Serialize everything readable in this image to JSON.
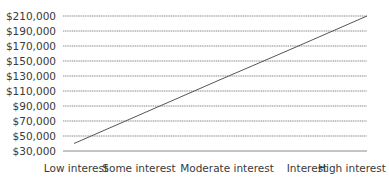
{
  "chart_data": {
    "type": "line",
    "title": "",
    "xlabel": "",
    "ylabel": "",
    "categories": [
      "Low interest",
      "Some interest",
      "Moderate interest",
      "Interest",
      "High interest"
    ],
    "series": [
      {
        "name": "Value",
        "values": [
          40000,
          82500,
          125000,
          167500,
          210000
        ],
        "color": "#555555"
      }
    ],
    "y_ticks": [
      30000,
      50000,
      70000,
      90000,
      110000,
      130000,
      150000,
      170000,
      190000,
      210000
    ],
    "y_tick_labels": [
      "$30,000",
      "$50,000",
      "$70,000",
      "$90,000",
      "$110,000",
      "$130,000",
      "$150,000",
      "$170,000",
      "$190,000",
      "$210,000"
    ],
    "ylim": [
      30000,
      210000
    ],
    "grid": true,
    "legend": "none"
  },
  "colors": {
    "gridline": "#8a8a8a",
    "line": "#555555",
    "text": "#3a3a3a"
  }
}
